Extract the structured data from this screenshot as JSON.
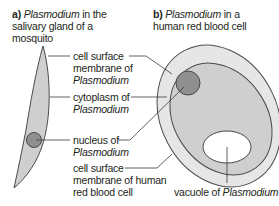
{
  "panels": {
    "a": {
      "letter": "a)",
      "title_italic": "Plasmodium",
      "title_line1_rest": " in the",
      "title_line2": "salivary gland of a",
      "title_line3": "mosquito"
    },
    "b": {
      "letter": "b)",
      "title_italic": "Plasmodium",
      "title_line1_rest": " in a",
      "title_line2": "human red blood cell"
    }
  },
  "labels": {
    "cell_surface_membrane": {
      "line1": "cell surface",
      "line2": "membrane of",
      "line3_italic": "Plasmodium"
    },
    "cytoplasm": {
      "line1": "cytoplasm of",
      "line2_italic": "Plasmodium"
    },
    "nucleus": {
      "line1": "nucleus of",
      "line2_italic": "Plasmodium"
    },
    "rbc_membrane": {
      "line1": "cell surface",
      "line2": "membrane of human",
      "line3": "red blood cell"
    },
    "vacuole": {
      "text": "vacuole of ",
      "italic": "Plasmodium"
    }
  },
  "colors": {
    "outline": "#4a4a4a",
    "plasmodium_fill": "#cfcfcf",
    "rbc_fill": "#e6e6e6",
    "nucleus_fill": "#8f8f8f",
    "vacuole_fill": "#ffffff",
    "leader": "#3a3a3a"
  }
}
